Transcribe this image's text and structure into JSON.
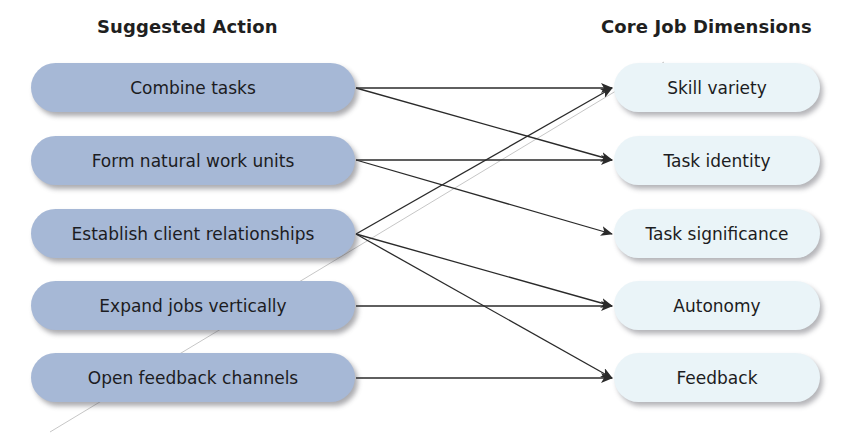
{
  "headings": {
    "left": "Suggested Action",
    "right": "Core Job Dimensions"
  },
  "suggested_actions": [
    {
      "id": "combine",
      "label": "Combine tasks"
    },
    {
      "id": "natural",
      "label": "Form natural work units"
    },
    {
      "id": "client",
      "label": "Establish client relationships"
    },
    {
      "id": "vertical",
      "label": "Expand jobs vertically"
    },
    {
      "id": "feedbackch",
      "label": "Open feedback channels"
    }
  ],
  "core_dimensions": [
    {
      "id": "skill",
      "label": "Skill variety"
    },
    {
      "id": "identity",
      "label": "Task identity"
    },
    {
      "id": "significance",
      "label": "Task significance"
    },
    {
      "id": "autonomy",
      "label": "Autonomy"
    },
    {
      "id": "feedback",
      "label": "Feedback"
    }
  ],
  "connections": [
    {
      "from": "Combine tasks",
      "to": "Skill variety"
    },
    {
      "from": "Combine tasks",
      "to": "Task identity"
    },
    {
      "from": "Form natural work units",
      "to": "Task identity"
    },
    {
      "from": "Form natural work units",
      "to": "Task significance"
    },
    {
      "from": "Establish client relationships",
      "to": "Skill variety"
    },
    {
      "from": "Establish client relationships",
      "to": "Autonomy"
    },
    {
      "from": "Establish client relationships",
      "to": "Feedback"
    },
    {
      "from": "Expand jobs vertically",
      "to": "Autonomy"
    },
    {
      "from": "Open feedback channels",
      "to": "Feedback"
    }
  ],
  "colors": {
    "action_fill": "#a6b8d6",
    "dimension_fill": "#eaf4f8",
    "arrow": "#2a2a2a",
    "text": "#1c1c22"
  }
}
